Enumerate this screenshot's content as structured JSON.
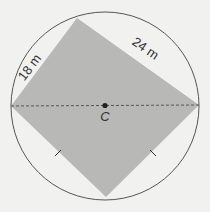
{
  "figure": {
    "side_labels": {
      "short_side": "18 m",
      "long_side": "24 m"
    },
    "center_label": "C",
    "colors": {
      "background": "#f1f1f0",
      "circle_stroke": "#555555",
      "region_fill": "#b8b8b6",
      "diameter_stroke": "#555555",
      "center_point": "#222222"
    }
  }
}
